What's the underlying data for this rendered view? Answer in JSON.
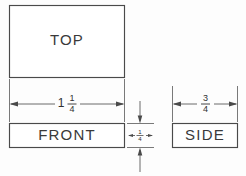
{
  "drawing": {
    "title": "Orthographic Projection - Three Views",
    "background_color": "#fdfdfd",
    "line_color": "#4a4a4a",
    "text_color": "#303030",
    "views": [
      {
        "id": "top",
        "label": "TOP",
        "x": 9,
        "y": 5,
        "width": 116,
        "height": 73
      },
      {
        "id": "front",
        "label": "FRONT",
        "x": 9,
        "y": 123,
        "width": 116,
        "height": 25
      },
      {
        "id": "side",
        "label": "SIDE",
        "x": 172,
        "y": 123,
        "width": 66,
        "height": 25
      }
    ],
    "dimensions": [
      {
        "id": "width-dimension",
        "text": "1 1/4",
        "whole": "1",
        "numerator": "1",
        "denominator": "4",
        "orientation": "horizontal",
        "arrows": "inside",
        "line_y": 104,
        "from_x": 9,
        "to_x": 125,
        "label_x": 67
      },
      {
        "id": "depth-dimension",
        "text": "3/4",
        "whole": "",
        "numerator": "3",
        "denominator": "4",
        "orientation": "horizontal",
        "arrows": "inside",
        "line_y": 104,
        "from_x": 172,
        "to_x": 238,
        "label_x": 205
      },
      {
        "id": "height-dimension",
        "text": "1/4",
        "whole": "",
        "numerator": "1",
        "denominator": "4",
        "orientation": "vertical",
        "arrows": "outside",
        "line_x": 140,
        "from_y": 123,
        "to_y": 148,
        "label_y": 135
      }
    ]
  }
}
